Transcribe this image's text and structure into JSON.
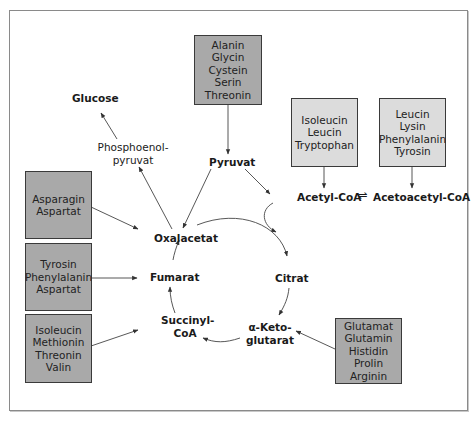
{
  "diagram": {
    "sources": {
      "alanin_group": [
        "Alanin",
        "Glycin",
        "Cystein",
        "Serin",
        "Threonin"
      ],
      "isoleucin_group": [
        "Isoleucin",
        "Leucin",
        "Tryptophan"
      ],
      "leucin_group": [
        "Leucin",
        "Lysin",
        "Phenylalanin",
        "Tyrosin"
      ],
      "asparagin_group": [
        "Asparagin",
        "Aspartat"
      ],
      "tyrosin_group": [
        "Tyrosin",
        "Phenylalanin",
        "Aspartat"
      ],
      "isoleucin_methionin_group": [
        "Isoleucin",
        "Methionin",
        "Threonin",
        "Valin"
      ],
      "glutamat_group": [
        "Glutamat",
        "Glutamin",
        "Histidin",
        "Prolin",
        "Arginin"
      ]
    },
    "metabolites": {
      "glucose": "Glucose",
      "pep_line1": "Phosphoenol-",
      "pep_line2": "pyruvat",
      "pyruvat": "Pyruvat",
      "acetyl_coa": "Acetyl-CoA",
      "equilibrium": "⇌",
      "acetoacetyl_coa": "Acetoacetyl-CoA",
      "oxalacetat": "Oxalacetat",
      "fumarat": "Fumarat",
      "citrat": "Citrat",
      "succinyl_line1": "Succinyl-",
      "succinyl_line2": "CoA",
      "ketoglutarat_line1": "α-Keto-",
      "ketoglutarat_line2": "glutarat"
    },
    "colors": {
      "glucogenic_box": "#a9a9a9",
      "ketogenic_box": "#dcdcdc",
      "border": "#3a3a3a",
      "arrow": "#333333"
    }
  }
}
